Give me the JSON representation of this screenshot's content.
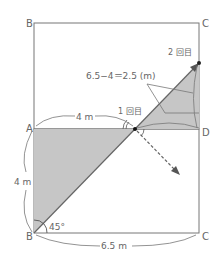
{
  "diagram": {
    "points": {
      "top_left": "B",
      "top_right": "C",
      "mid_left": "A",
      "mid_right": "D",
      "bottom_left": "B",
      "bottom_right": "C"
    },
    "labels": {
      "ab_length": "4 m",
      "ad_partial_length": "4 m",
      "bc_length": "6.5 m",
      "angle": "45°",
      "equation": "6.5−4＝2.5 (m)",
      "first_fold": "1 回目",
      "second_fold": "2 回目"
    },
    "colors": {
      "line": "#666666",
      "shade": "#c8c8c8",
      "text": "#666666"
    }
  }
}
